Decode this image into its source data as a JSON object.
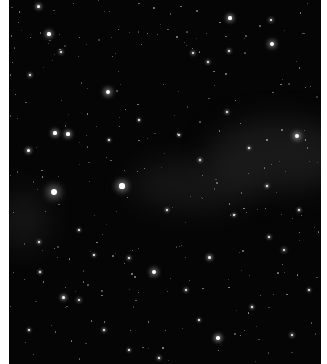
{
  "image": {
    "description": "Night sky starfield with faint Milky Way band",
    "background_color": "#050505",
    "border_color": "#ffffff",
    "nebula_color": "#2a2a2a"
  },
  "nebulae": [
    {
      "x": 200,
      "y": 120,
      "w": 140,
      "h": 70,
      "opacity": 0.55
    },
    {
      "x": 120,
      "y": 160,
      "w": 130,
      "h": 50,
      "opacity": 0.45
    },
    {
      "x": -10,
      "y": 190,
      "w": 50,
      "h": 60,
      "opacity": 0.45
    }
  ],
  "stars": [
    {
      "x": 45,
      "y": 192,
      "r": 3.2
    },
    {
      "x": 113,
      "y": 186,
      "r": 2.6
    },
    {
      "x": 99,
      "y": 92,
      "r": 2.2
    },
    {
      "x": 263,
      "y": 44,
      "r": 2
    },
    {
      "x": 288,
      "y": 136,
      "r": 2.2
    },
    {
      "x": 145,
      "y": 272,
      "r": 2
    },
    {
      "x": 209,
      "y": 338,
      "r": 1.8
    },
    {
      "x": 46,
      "y": 133,
      "r": 1.6
    },
    {
      "x": 59,
      "y": 134,
      "r": 1.6
    },
    {
      "x": 29,
      "y": 6,
      "r": 1.5
    },
    {
      "x": 40,
      "y": 34,
      "r": 1.6
    },
    {
      "x": 221,
      "y": 18,
      "r": 1.6
    },
    {
      "x": 262,
      "y": 20,
      "r": 1.4
    },
    {
      "x": 184,
      "y": 53,
      "r": 1.3
    },
    {
      "x": 52,
      "y": 52,
      "r": 1.3
    },
    {
      "x": 21,
      "y": 75,
      "r": 1.2
    },
    {
      "x": 199,
      "y": 62,
      "r": 1.2
    },
    {
      "x": 220,
      "y": 51,
      "r": 1.2
    },
    {
      "x": 19,
      "y": 150,
      "r": 1.5
    },
    {
      "x": 191,
      "y": 160,
      "r": 1.2
    },
    {
      "x": 218,
      "y": 112,
      "r": 1.2
    },
    {
      "x": 275,
      "y": 250,
      "r": 1.4
    },
    {
      "x": 200,
      "y": 257,
      "r": 1.5
    },
    {
      "x": 54,
      "y": 297,
      "r": 1.5
    },
    {
      "x": 70,
      "y": 300,
      "r": 1.4
    },
    {
      "x": 177,
      "y": 290,
      "r": 1.2
    },
    {
      "x": 95,
      "y": 330,
      "r": 1.2
    },
    {
      "x": 283,
      "y": 335,
      "r": 1.3
    },
    {
      "x": 260,
      "y": 237,
      "r": 1.2
    },
    {
      "x": 120,
      "y": 258,
      "r": 1.2
    },
    {
      "x": 258,
      "y": 186,
      "r": 1.1
    },
    {
      "x": 31,
      "y": 272,
      "r": 1.1
    },
    {
      "x": 243,
      "y": 307,
      "r": 1.1
    },
    {
      "x": 30,
      "y": 242,
      "r": 1.1
    },
    {
      "x": 158,
      "y": 210,
      "r": 1.1
    },
    {
      "x": 290,
      "y": 210,
      "r": 1.1
    },
    {
      "x": 150,
      "y": 358,
      "r": 1.2
    },
    {
      "x": 100,
      "y": 140,
      "r": 1
    },
    {
      "x": 130,
      "y": 120,
      "r": 1
    },
    {
      "x": 170,
      "y": 135,
      "r": 1
    },
    {
      "x": 240,
      "y": 148,
      "r": 1
    },
    {
      "x": 70,
      "y": 230,
      "r": 1
    },
    {
      "x": 85,
      "y": 255,
      "r": 1
    },
    {
      "x": 225,
      "y": 215,
      "r": 1
    },
    {
      "x": 300,
      "y": 290,
      "r": 1
    },
    {
      "x": 190,
      "y": 320,
      "r": 1
    },
    {
      "x": 120,
      "y": 350,
      "r": 1
    },
    {
      "x": 20,
      "y": 330,
      "r": 1
    }
  ]
}
